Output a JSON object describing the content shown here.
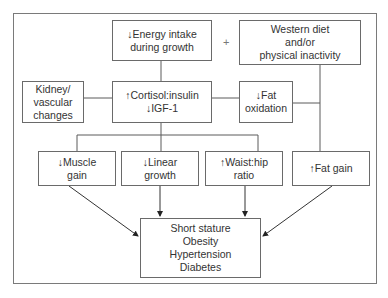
{
  "diagram": {
    "nodes": {
      "energy": "↓Energy intake\nduring growth",
      "western": "Western diet\nand/or\nphysical inactivity",
      "kidney": "Kidney/\nvascular\nchanges",
      "cortisol": "↑Cortisol:insulin\n↓IGF-1",
      "fat_oxidation": "↓Fat\noxidation",
      "muscle": "↓Muscle\ngain",
      "linear": "↓Linear\ngrowth",
      "waist": "↑Waist:hip\nratio",
      "fat_gain": "↑Fat gain",
      "outcomes": "Short stature\nObesity\nHypertension\nDiabetes"
    },
    "operator": "+",
    "colors": {
      "line": "#5a5a5a",
      "border": "#6a6a6a",
      "text": "#333333"
    }
  }
}
